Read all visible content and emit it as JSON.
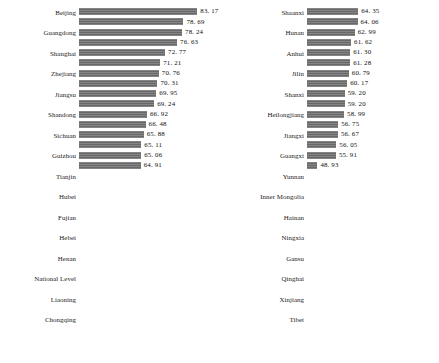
{
  "figure": {
    "background_color": "#ffffff",
    "bar_color": "#6e6e6e",
    "text_color": "#111111",
    "panel_count": 2
  },
  "chart_data": [
    {
      "type": "bar",
      "orientation": "horizontal",
      "panel": "left",
      "title": "",
      "xlabel": "",
      "ylabel": "",
      "grid": false,
      "legend": false,
      "xlim": [
        45,
        85
      ],
      "value_labels_shown": true,
      "categories": [
        "Beijing",
        "Guangdong",
        "Shanghai",
        "Zhejiang",
        "Jiangsu",
        "Shandong",
        "Sichuan",
        "Guizhou",
        "Tianjin",
        "Hubei",
        "Fujian",
        "Hebei",
        "Henan",
        "National Level",
        "Liaoning",
        "Chongqing"
      ],
      "tick_labels_visible": [
        "Beijing",
        "Guangdong",
        "Shanghai",
        "Zhejiang",
        "Jiangsu",
        "Shandong",
        "Sichuan",
        "Guizhou",
        "Tianjin",
        "Hubei",
        "Fujian",
        "Hebei",
        "Henan",
        "National Level",
        "Liaoning",
        "Chongqing"
      ],
      "values": [
        83.17,
        78.69,
        78.24,
        76.63,
        72.77,
        71.21,
        70.76,
        70.31,
        69.95,
        69.24,
        66.92,
        66.48,
        65.88,
        65.11,
        65.06,
        64.91
      ],
      "value_text": [
        "83. 17",
        "78. 69",
        "78. 24",
        "76. 63",
        "72. 77",
        "71. 21",
        "70. 76",
        "70. 31",
        "69. 95",
        "69. 24",
        "66. 92",
        "66. 48",
        "65. 88",
        "65. 11",
        "65. 06",
        "64. 91"
      ]
    },
    {
      "type": "bar",
      "orientation": "horizontal",
      "panel": "right",
      "title": "",
      "xlabel": "",
      "ylabel": "",
      "grid": false,
      "legend": false,
      "xlim": [
        45,
        85
      ],
      "value_labels_shown": true,
      "categories": [
        "Shaanxi",
        "Hunan",
        "Anhui",
        "Jilin",
        "Shanxi",
        "Heilongjiang",
        "Jiangxi",
        "Guangxi",
        "Yunnan",
        "Inner Mongolia",
        "Hainan",
        "Ningxia",
        "Gansu",
        "Qinghai",
        "Xinjiang",
        "Tibet"
      ],
      "tick_labels_visible": [
        "Shaanxi",
        "Hunan",
        "Anhui",
        "Jilin",
        "Shanxi",
        "Heilongjiang",
        "Jiangxi",
        "Guangxi",
        "Yunnan",
        "Inner Mongolia",
        "Hainan",
        "Ningxia",
        "Gansu",
        "Qinghai",
        "Xinjiang",
        "Tibet"
      ],
      "values": [
        64.35,
        64.06,
        62.99,
        61.62,
        61.3,
        61.28,
        60.79,
        60.17,
        59.2,
        59.2,
        58.99,
        56.75,
        56.67,
        56.05,
        55.91,
        48.93
      ],
      "value_text": [
        "64. 35",
        "64. 06",
        "62. 99",
        "61. 62",
        "61. 30",
        "61. 28",
        "60. 79",
        "60. 17",
        "59. 20",
        "59. 20",
        "58. 99",
        "56. 75",
        "56. 67",
        "56. 05",
        "55. 91",
        "48. 93"
      ]
    }
  ]
}
